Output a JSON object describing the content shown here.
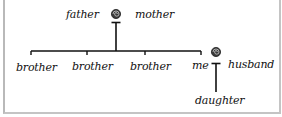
{
  "diagram": {
    "type": "family-tree",
    "style": "handwritten",
    "colors": {
      "ink": "#111111",
      "frame": "#bdbdbd",
      "background": "#ffffff"
    },
    "parents": {
      "left_label": "father",
      "right_label": "mother",
      "union_symbol": "spiral-knot-icon"
    },
    "children": [
      {
        "label": "brother"
      },
      {
        "label": "brother"
      },
      {
        "label": "brother"
      },
      {
        "label": "me"
      }
    ],
    "marriage": {
      "left_label": "me",
      "right_label": "husband",
      "union_symbol": "spiral-knot-icon"
    },
    "grandchildren": [
      {
        "label": "daughter"
      }
    ]
  }
}
